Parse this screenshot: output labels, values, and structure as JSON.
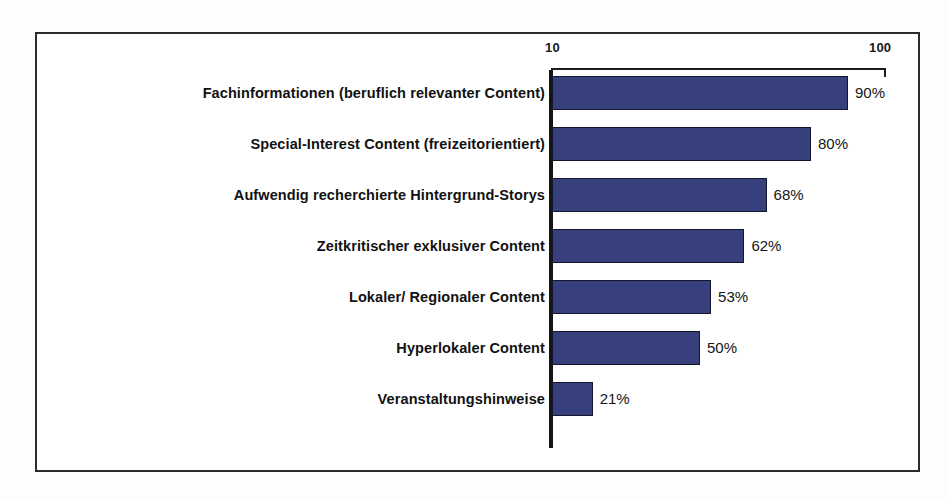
{
  "chart_data": {
    "type": "bar",
    "orientation": "horizontal",
    "title": "",
    "subtitle": "",
    "xlabel": "",
    "ylabel": "",
    "xlim": [
      10,
      100
    ],
    "grid": false,
    "legend": null,
    "axis_ticks": [
      "10",
      "100"
    ],
    "value_suffix": "%",
    "bar_color": "#373f7d",
    "bar_outline_color": "#15152e",
    "frame_color": "#2b2b2b",
    "axis_color": "#151515",
    "categories": [
      "Fachinformationen (beruflich relevanter Content)",
      "Special-Interest Content (freizeitorientiert)",
      "Aufwendig recherchierte Hintergrund-Storys",
      "Zeitkritischer exklusiver Content",
      "Lokaler/ Regionaler Content",
      "Hyperlokaler Content",
      "Veranstaltungshinweise"
    ],
    "values": [
      90,
      80,
      68,
      62,
      53,
      50,
      21
    ],
    "value_labels": [
      "90%",
      "80%",
      "68%",
      "62%",
      "53%",
      "50%",
      "21%"
    ]
  }
}
